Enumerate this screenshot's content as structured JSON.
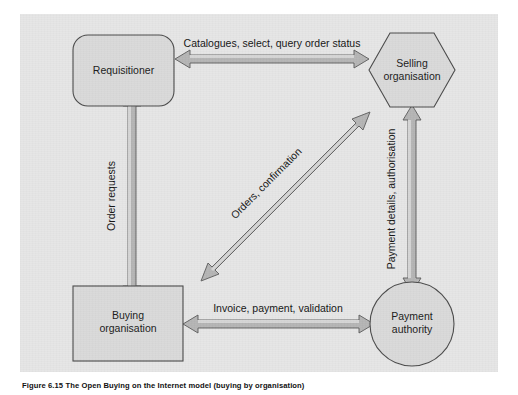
{
  "figure": {
    "caption": "Figure 6.15 The Open Buying on the Internet model (buying by organisation)",
    "panel_color": "#e6e6e6",
    "shape_fill": "#dadada",
    "shape_stroke": "#4a4a4a",
    "arrow_fill": "#b5b5b5",
    "arrow_stroke": "#5a5a5a"
  },
  "nodes": [
    {
      "id": "requisitioner",
      "shape": "rounded-rectangle",
      "line1": "Requisitioner",
      "line2": ""
    },
    {
      "id": "selling-organisation",
      "shape": "hexagon",
      "line1": "Selling",
      "line2": "organisation"
    },
    {
      "id": "buying-organisation",
      "shape": "square",
      "line1": "Buying",
      "line2": "organisation"
    },
    {
      "id": "payment-authority",
      "shape": "circle",
      "line1": "Payment",
      "line2": "authority"
    }
  ],
  "connectors": [
    {
      "id": "catalogues",
      "label": "Catalogues, select, query order status",
      "from": "requisitioner",
      "to": "selling-organisation",
      "direction": "bidirectional",
      "orientation": "horizontal"
    },
    {
      "id": "order-requests",
      "label": "Order requests",
      "from": "buying-organisation",
      "to": "requisitioner",
      "direction": "bidirectional",
      "orientation": "vertical"
    },
    {
      "id": "orders",
      "label": "Orders, confirmation",
      "from": "buying-organisation",
      "to": "selling-organisation",
      "direction": "bidirectional",
      "orientation": "diagonal"
    },
    {
      "id": "payment-details",
      "label": "Payment details, authorisation",
      "from": "payment-authority",
      "to": "selling-organisation",
      "direction": "bidirectional",
      "orientation": "vertical"
    },
    {
      "id": "invoice",
      "label": "Invoice, payment, validation",
      "from": "buying-organisation",
      "to": "payment-authority",
      "direction": "bidirectional",
      "orientation": "horizontal"
    }
  ]
}
